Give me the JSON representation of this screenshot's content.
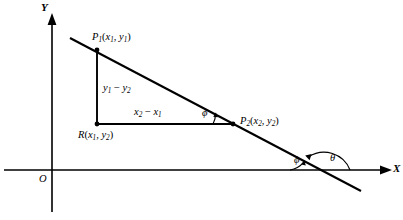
{
  "figure": {
    "type": "geometry-diagram",
    "background_color": "#ffffff",
    "stroke_color": "#000000"
  },
  "axes": {
    "x_label": "X",
    "y_label": "Y",
    "origin_label": "O",
    "x_axis": {
      "y_px": 170,
      "x_start_px": 4,
      "x_end_px": 392
    },
    "y_axis": {
      "x_px": 52,
      "y_start_px": 14,
      "y_end_px": 212
    }
  },
  "points": [
    {
      "name": "P1",
      "label_main": "P",
      "label_sub": "1",
      "label_coords": "(x",
      "label_full": "P1(x1, y1)",
      "x_px": 97,
      "y_px": 50,
      "dot": true
    },
    {
      "name": "P2",
      "label_main": "P",
      "label_sub": "2",
      "label_full": "P2(x2, y2)",
      "x_px": 233,
      "y_px": 124,
      "dot": true
    },
    {
      "name": "R",
      "label_main": "R",
      "label_full": "R(x1, y2)",
      "x_px": 97,
      "y_px": 124,
      "dot": true
    }
  ],
  "labels": {
    "p1": {
      "base": "P",
      "sub": "1",
      "open": "(",
      "x": "x",
      "xsub": "1",
      "comma": ", ",
      "y": "y",
      "ysub": "1",
      "close": ")"
    },
    "p2": {
      "base": "P",
      "sub": "2",
      "open": "(",
      "x": "x",
      "xsub": "2",
      "comma": ", ",
      "y": "y",
      "ysub": "2",
      "close": ")"
    },
    "r": {
      "base": "R",
      "sub": "",
      "open": "(",
      "x": "x",
      "xsub": "1",
      "comma": ", ",
      "y": "y",
      "ysub": "2",
      "close": ")"
    },
    "vertical_leg": {
      "a": "y",
      "asub": "1",
      "op": " − ",
      "b": "y",
      "bsub": "2"
    },
    "horizontal_leg": {
      "a": "x",
      "asub": "2",
      "op": " − ",
      "b": "x",
      "bsub": "1"
    }
  },
  "angles": [
    {
      "name": "phi-at-p2",
      "symbol": "ϕ",
      "x_px": 204,
      "y_px": 112
    },
    {
      "name": "phi-at-axis",
      "symbol": "ϕ",
      "x_px": 296,
      "y_px": 158
    },
    {
      "name": "theta-at-axis",
      "symbol": "θ",
      "x_px": 332,
      "y_px": 157
    }
  ],
  "line": {
    "name": "oblique-line",
    "x1_px": 70,
    "y1_px": 38,
    "x2_px": 361,
    "y2_px": 191
  },
  "triangle": {
    "vertices": [
      "P1",
      "R",
      "P2"
    ],
    "vertical_leg_label": "y1 - y2",
    "horizontal_leg_label": "x2 - x1"
  }
}
